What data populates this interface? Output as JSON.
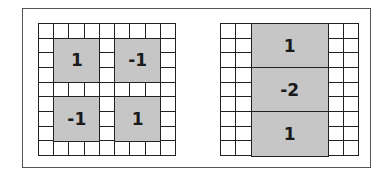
{
  "diagram": {
    "colors": {
      "shade": "#c6c6c6",
      "line": "#222222",
      "frame": "#555555",
      "background": "#ffffff"
    },
    "left_grid": {
      "cols": 9,
      "rows": 9,
      "blocks": [
        {
          "label": "1",
          "col": 1,
          "row": 1,
          "w": 3,
          "h": 3
        },
        {
          "label": "-1",
          "col": 5,
          "row": 1,
          "w": 3,
          "h": 3
        },
        {
          "label": "-1",
          "col": 1,
          "row": 5,
          "w": 3,
          "h": 3
        },
        {
          "label": "1",
          "col": 5,
          "row": 5,
          "w": 3,
          "h": 3
        }
      ]
    },
    "right_grid": {
      "cols": 9,
      "rows": 9,
      "blocks": [
        {
          "label": "1",
          "col": 2,
          "row": 0,
          "w": 5,
          "h": 3
        },
        {
          "label": "-2",
          "col": 2,
          "row": 3,
          "w": 5,
          "h": 3
        },
        {
          "label": "1",
          "col": 2,
          "row": 6,
          "w": 5,
          "h": 3
        }
      ]
    }
  }
}
